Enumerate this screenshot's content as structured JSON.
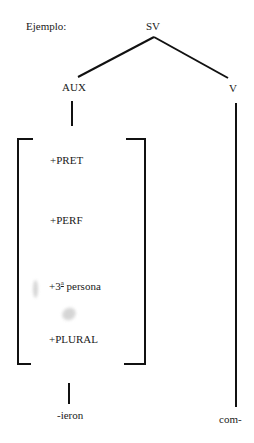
{
  "diagram": {
    "example_label": "Ejemplo:",
    "root": {
      "label": "SV"
    },
    "children": [
      {
        "label": "AUX",
        "features": [
          {
            "text": "+PRET"
          },
          {
            "text": "+PERF"
          },
          {
            "prefix": "+3",
            "superscript": "a",
            "suffix": "persona"
          },
          {
            "text": "+PLURAL"
          }
        ],
        "morpheme": "-ieron"
      },
      {
        "label": "V",
        "morpheme": "com-"
      }
    ],
    "line_color": "#111111"
  }
}
